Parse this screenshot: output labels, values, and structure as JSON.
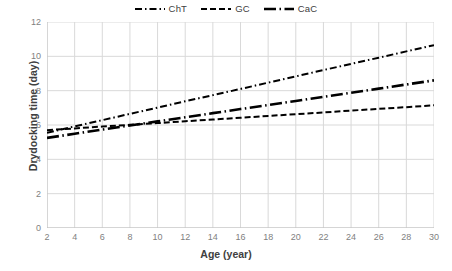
{
  "chart_data": {
    "type": "line",
    "title": "",
    "xlabel": "Age (year)",
    "ylabel": "Drydocking time (day)",
    "xlim": [
      2,
      30
    ],
    "ylim": [
      0,
      12
    ],
    "xticks": [
      2,
      4,
      6,
      8,
      10,
      12,
      14,
      16,
      18,
      20,
      22,
      24,
      26,
      28,
      30
    ],
    "yticks": [
      0,
      2,
      4,
      6,
      8,
      10,
      12
    ],
    "grid": true,
    "legend_position": "top-center",
    "x": [
      2,
      4,
      6,
      8,
      10,
      12,
      14,
      16,
      18,
      20,
      22,
      24,
      26,
      28,
      30
    ],
    "series": [
      {
        "name": "ChT",
        "dash": "dash-dot",
        "color": "#000000",
        "values": [
          5.55,
          5.92,
          6.28,
          6.65,
          7.01,
          7.38,
          7.74,
          8.1,
          8.47,
          8.83,
          9.2,
          9.56,
          9.92,
          10.29,
          10.65
        ]
      },
      {
        "name": "GC",
        "dash": "dashed",
        "color": "#000000",
        "values": [
          5.7,
          5.8,
          5.91,
          6.01,
          6.11,
          6.22,
          6.32,
          6.42,
          6.53,
          6.63,
          6.73,
          6.84,
          6.94,
          7.04,
          7.15
        ]
      },
      {
        "name": "CaC",
        "dash": "long-dash-dot",
        "color": "#000000",
        "values": [
          5.25,
          5.49,
          5.73,
          5.97,
          6.21,
          6.45,
          6.69,
          6.93,
          7.16,
          7.4,
          7.64,
          7.88,
          8.12,
          8.36,
          8.6
        ]
      }
    ]
  },
  "legend": {
    "items": [
      {
        "label": "ChT"
      },
      {
        "label": "GC"
      },
      {
        "label": "CaC"
      }
    ]
  },
  "colors": {
    "line": "#000000",
    "grid": "#d9d9d9",
    "axis": "#bfbfbf",
    "tick_text": "#7f7f7f",
    "title_text": "#404040",
    "background": "#ffffff"
  }
}
